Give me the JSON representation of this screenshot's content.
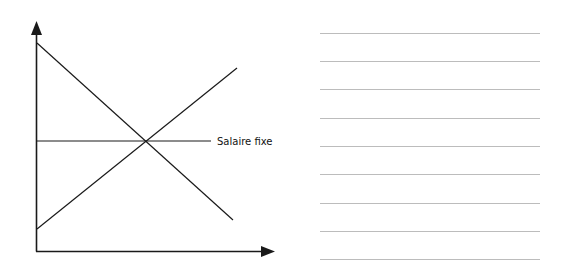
{
  "diagram": {
    "horizontal_line_label": "Salaire fixe",
    "colors": {
      "stroke": "#1a1a1a",
      "answer_lines": "#bcbcbc"
    }
  },
  "answer_lines": {
    "count": 9
  }
}
